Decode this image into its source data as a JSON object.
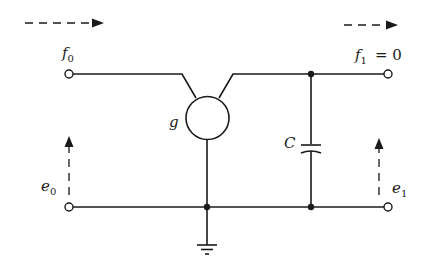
{
  "diagram": {
    "type": "circuit",
    "labels": {
      "input_flow": {
        "symbol": "f",
        "subscript": "0"
      },
      "output_flow": {
        "symbol": "f",
        "subscript": "1",
        "suffix": "= 0"
      },
      "input_effort": {
        "symbol": "e",
        "subscript": "0"
      },
      "output_effort": {
        "symbol": "e",
        "subscript": "1"
      },
      "gyrator": "g",
      "capacitor": "C"
    },
    "elements": [
      {
        "id": "gyrator",
        "label": "g",
        "kind": "two-port element (circle)"
      },
      {
        "id": "capacitor",
        "label": "C",
        "kind": "capacitor"
      },
      {
        "id": "ground",
        "kind": "ground symbol"
      }
    ],
    "terminals": [
      "f0 (top-left)",
      "f1 (top-right)",
      "e0 (bottom-left)",
      "e1 (bottom-right)"
    ],
    "arrows": [
      "dashed right arrow above f0",
      "dashed right arrow above f1",
      "dashed up arrow at e0",
      "dashed up arrow at e1"
    ]
  }
}
